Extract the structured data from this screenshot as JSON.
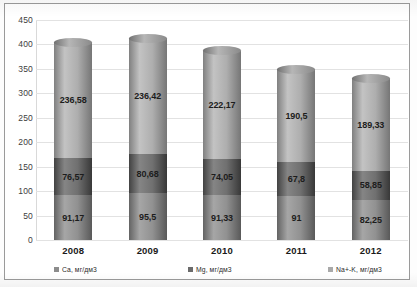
{
  "chart_data": {
    "type": "bar",
    "stacked": true,
    "title": "",
    "xlabel": "",
    "ylabel": "",
    "ylim": [
      0,
      450
    ],
    "ytick_step": 50,
    "yticks": [
      "450",
      "400",
      "350",
      "300",
      "250",
      "200",
      "150",
      "100",
      "50",
      "0"
    ],
    "grid": true,
    "legend_position": "bottom",
    "categories": [
      "2008",
      "2009",
      "2010",
      "2011",
      "2012"
    ],
    "series": [
      {
        "name": "Ca, мг/дм3",
        "color": "#8c8c8c",
        "values": [
          91.17,
          95.5,
          91.33,
          91,
          82.25
        ],
        "labels": [
          "91,17",
          "95,5",
          "91,33",
          "91",
          "82,25"
        ]
      },
      {
        "name": "Mg, мг/дм3",
        "color": "#6b6b6b",
        "values": [
          76.57,
          80.68,
          74.05,
          67.8,
          58.85
        ],
        "labels": [
          "76,57",
          "80,68",
          "74,05",
          "67,8",
          "58,85"
        ]
      },
      {
        "name": "Na+-K, мг/дм3",
        "color": "#a9a9a9",
        "values": [
          236.58,
          236.42,
          222.17,
          190.5,
          189.33
        ],
        "labels": [
          "236,58",
          "236,42",
          "222,17",
          "190,5",
          "189,33"
        ]
      }
    ]
  },
  "legend": {
    "items": [
      {
        "label": "Ca, мг/дм3",
        "color": "#8c8c8c"
      },
      {
        "label": "Mg, мг/дм3",
        "color": "#6b6b6b"
      },
      {
        "label": "Na+-K, мг/дм3",
        "color": "#a9a9a9"
      }
    ]
  },
  "colors": {
    "grid": "#e2e2e2",
    "frame": "#9a9a9a",
    "text": "#1c1c1c",
    "background": "#ffffff"
  }
}
